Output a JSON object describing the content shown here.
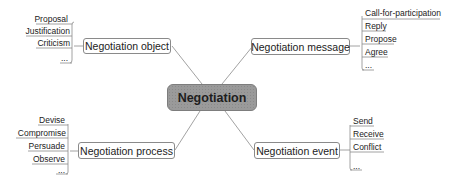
{
  "center": {
    "label": "Negotiation"
  },
  "branches": {
    "object": {
      "label": "Negotiation object",
      "items": [
        "Proposal",
        "Justification",
        "Criticism",
        "..."
      ]
    },
    "message": {
      "label": "Negotiation message",
      "items": [
        "Call-for-participation",
        "Reply",
        "Propose",
        "Agree",
        "..."
      ]
    },
    "process": {
      "label": "Negotiation process",
      "items": [
        "Devise",
        "Compromise",
        "Persuade",
        "Observe",
        "..."
      ]
    },
    "event": {
      "label": "Negotiation event",
      "items": [
        "Send",
        "Receive",
        "Conflict",
        "..."
      ]
    }
  },
  "colors": {
    "center_fill": "#9a9a9a",
    "line": "#8a8a8a",
    "text": "#222222"
  }
}
